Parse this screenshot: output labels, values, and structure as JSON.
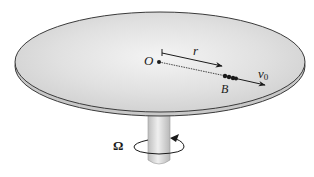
{
  "figure": {
    "labels": {
      "origin": "O",
      "radius": "r",
      "bead": "B",
      "velocity_symbol": "v",
      "velocity_subscript": "0",
      "angular_velocity": "Ω"
    },
    "colors": {
      "disk_fill": "#d8d8d8",
      "disk_highlight": "#f2f2f2",
      "edge_fill": "#c4c4c4",
      "outline": "#3a3a3a",
      "shaft_fill": "#d0d0d0",
      "ink": "#1a1a1a"
    }
  }
}
